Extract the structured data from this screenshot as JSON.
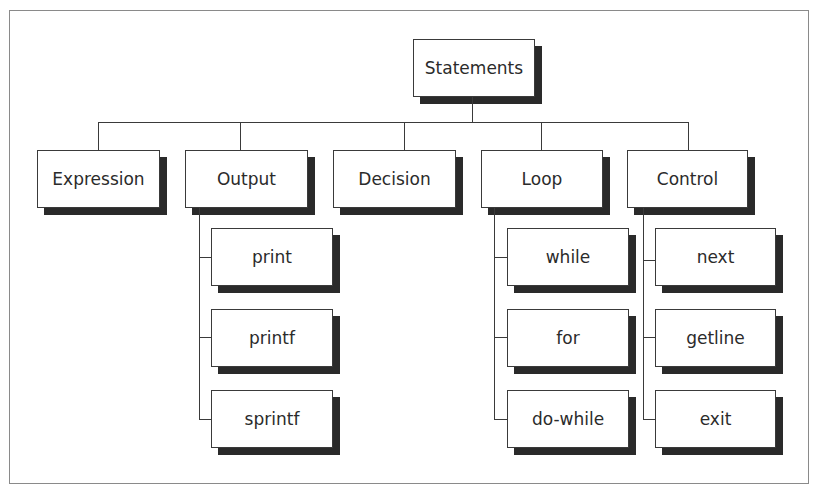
{
  "diagram": {
    "type": "tree",
    "root": {
      "label": "Statements"
    },
    "categories": [
      {
        "label": "Expression",
        "children": []
      },
      {
        "label": "Output",
        "children": [
          {
            "label": "print"
          },
          {
            "label": "printf"
          },
          {
            "label": "sprintf"
          }
        ]
      },
      {
        "label": "Decision",
        "children": []
      },
      {
        "label": "Loop",
        "children": [
          {
            "label": "while"
          },
          {
            "label": "for"
          },
          {
            "label": "do-while"
          }
        ]
      },
      {
        "label": "Control",
        "children": [
          {
            "label": "next"
          },
          {
            "label": "getline"
          },
          {
            "label": "exit"
          }
        ]
      }
    ]
  }
}
